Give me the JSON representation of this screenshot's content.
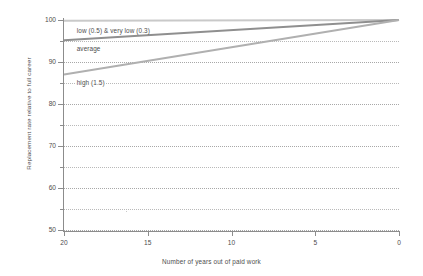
{
  "chart_data": {
    "type": "line",
    "title": "",
    "subtitle": "",
    "xlabel": "Number of years out of paid work",
    "ylabel": "Replacement rate relative to full career",
    "xlim": [
      20,
      0
    ],
    "ylim": [
      50,
      100
    ],
    "x_reversed": true,
    "grid": true,
    "grid_style": "dotted-horizontal",
    "legend": "inline-annotations",
    "xticks": [
      20,
      15,
      10,
      5,
      0
    ],
    "xtick_labels": [
      "20",
      "15",
      "10",
      "5",
      "0"
    ],
    "yticks": [
      50,
      60,
      70,
      80,
      90,
      100
    ],
    "ytick_labels": [
      "50",
      "60",
      "70",
      "80",
      "90",
      "100"
    ],
    "y_minor_ticks": [
      55,
      65,
      75,
      85,
      95
    ],
    "x": [
      20,
      0
    ],
    "series": [
      {
        "name": "low (0.5) & very low (0.3)",
        "label": "low (0.5) & very low (0.3)",
        "values": [
          99.8,
          100.0
        ],
        "color": "#c9c9c9",
        "width": 2.0
      },
      {
        "name": "average",
        "label": "average",
        "values": [
          95.2,
          100.0
        ],
        "color": "#8f8f8f",
        "width": 2.0
      },
      {
        "name": "high (1.5)",
        "label": "high (1.5)",
        "values": [
          87.0,
          100.0
        ],
        "color": "#b0b0b0",
        "width": 2.0
      }
    ],
    "annotations": [
      {
        "text": "low (0.5) & very low (0.3)",
        "x": 19.3,
        "y": 97.5
      },
      {
        "text": "average",
        "x": 19.3,
        "y": 93.0
      },
      {
        "text": "high (1.5)",
        "x": 19.3,
        "y": 85.0
      }
    ]
  },
  "axes": {
    "x_title": "Number of years out of paid work",
    "y_title": "Replacement rate relative to full career"
  },
  "colors": {
    "axis": "#8c8c8c",
    "grid": "#b9b9b9",
    "text": "#4d4d4d",
    "background": "#ffffff",
    "series_low": "#c9c9c9",
    "series_average": "#8f8f8f",
    "series_high": "#b0b0b0"
  }
}
